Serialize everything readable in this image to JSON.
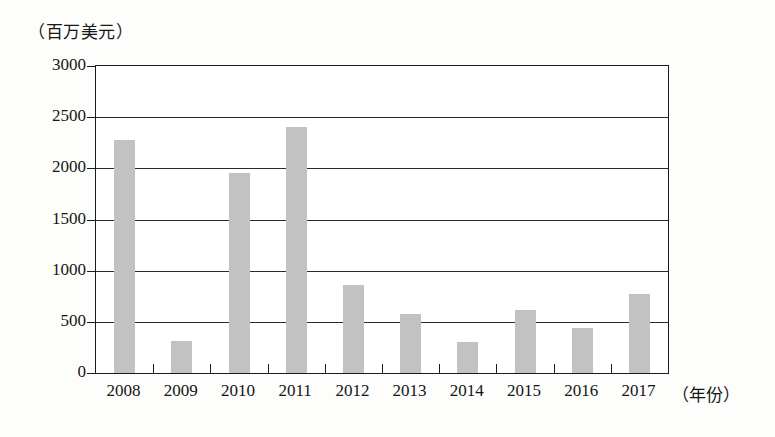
{
  "chart_data": {
    "type": "bar",
    "title": "",
    "subtitle": "",
    "xlabel": "（年份）",
    "ylabel": "（百万美元）",
    "categories": [
      "2008",
      "2009",
      "2010",
      "2011",
      "2012",
      "2013",
      "2014",
      "2015",
      "2016",
      "2017"
    ],
    "values": [
      2280,
      310,
      1950,
      2400,
      860,
      580,
      300,
      620,
      440,
      770
    ],
    "ylim": [
      0,
      3000
    ],
    "yticks": [
      0,
      500,
      1000,
      1500,
      2000,
      2500,
      3000
    ],
    "ytick_labels": [
      "0",
      "500",
      "1000",
      "1500",
      "2000",
      "2500",
      "3000"
    ],
    "grid": true,
    "grid_axis": "y",
    "legend": false,
    "legend_position": "none",
    "bar_color": "#c2c2c2",
    "axis_color": "#1b1b1b",
    "background_color": "#ffffff"
  },
  "axes": {
    "y_unit_caption": "（百万美元）",
    "x_unit_caption": "（年份）"
  }
}
